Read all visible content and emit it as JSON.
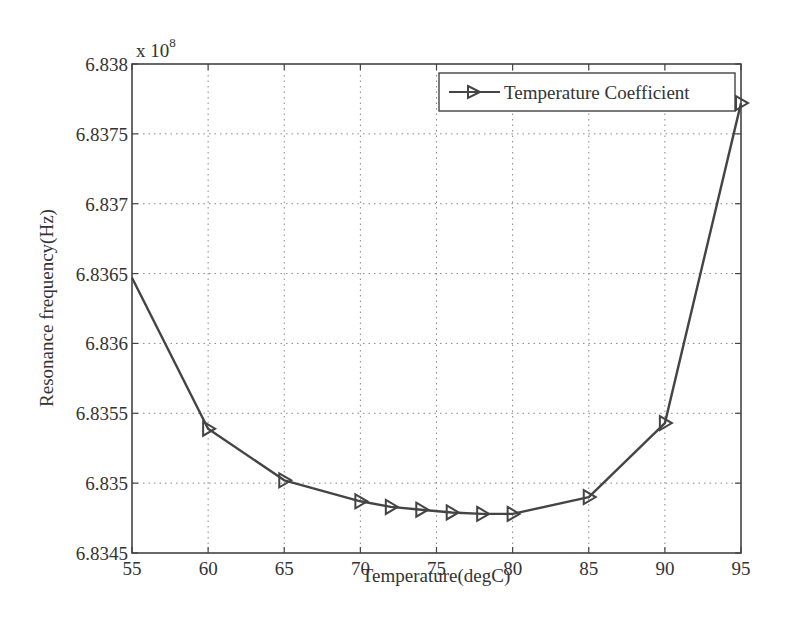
{
  "chart_data": {
    "type": "line",
    "title": "",
    "xlabel": "Temperature(degC)",
    "ylabel": "Resonance frequency(Hz)",
    "y_multiplier_label": "x 10",
    "y_multiplier_exponent": "8",
    "xlim": [
      55,
      95
    ],
    "ylim": [
      6.8345,
      6.838
    ],
    "x_ticks": [
      55,
      60,
      65,
      70,
      75,
      80,
      85,
      90,
      95
    ],
    "x_tick_labels": [
      "55",
      "60",
      "65",
      "70",
      "75",
      "80",
      "85",
      "90",
      "95"
    ],
    "y_ticks": [
      6.8345,
      6.835,
      6.8355,
      6.836,
      6.8365,
      6.837,
      6.8375,
      6.838
    ],
    "y_tick_labels": [
      "6.8345",
      "6.835",
      "6.8355",
      "6.836",
      "6.8365",
      "6.837",
      "6.8375",
      "6.838"
    ],
    "grid": true,
    "legend_position": "upper right",
    "series": [
      {
        "name": "Temperature Coefficient",
        "marker": "triangle-right",
        "color": "#444444",
        "x": [
          55,
          60,
          65,
          70,
          72,
          74,
          76,
          78,
          80,
          85,
          90,
          95
        ],
        "values": [
          6.83647,
          6.83539,
          6.83502,
          6.83487,
          6.83483,
          6.83481,
          6.83479,
          6.83478,
          6.83478,
          6.8349,
          6.83543,
          6.83772
        ],
        "markers_shown": [
          false,
          true,
          true,
          true,
          true,
          true,
          true,
          true,
          true,
          true,
          true,
          true
        ]
      }
    ]
  },
  "colors": {
    "axis": "#444444",
    "grid": "#888888",
    "line": "#444444",
    "text": "#333333"
  }
}
